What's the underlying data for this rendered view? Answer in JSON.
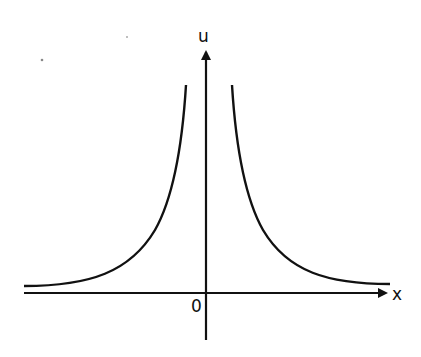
{
  "diagram": {
    "type": "function-plot",
    "axes": {
      "x_label": "x",
      "y_label": "u",
      "origin_label": "0"
    },
    "curves": [
      {
        "name": "left-branch",
        "side": "x<0",
        "shape": "rises toward u-axis"
      },
      {
        "name": "right-branch",
        "side": "x>0",
        "shape": "decays away from u-axis"
      }
    ],
    "colors": {
      "stroke": "#111111",
      "background": "#ffffff"
    }
  }
}
